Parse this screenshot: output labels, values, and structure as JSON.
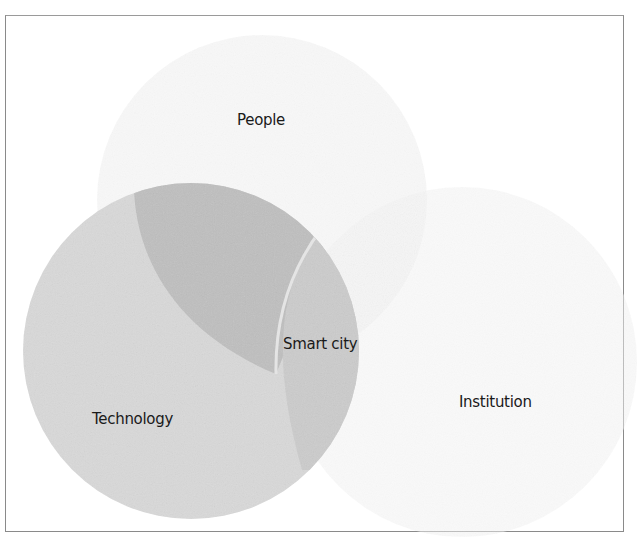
{
  "diagram": {
    "type": "venn",
    "sets": [
      {
        "id": "people",
        "label": "People",
        "color": "#f2f2f2"
      },
      {
        "id": "technology",
        "label": "Technology",
        "color": "#d6d6d6"
      },
      {
        "id": "institution",
        "label": "Institution",
        "color": "#f4f4f4"
      }
    ],
    "intersections": [
      {
        "sets": [
          "people",
          "technology"
        ],
        "color": "#bdbdbd"
      },
      {
        "sets": [
          "technology",
          "institution"
        ],
        "color": "#cacaca"
      },
      {
        "sets": [
          "people",
          "technology",
          "institution"
        ],
        "label": "Smart city",
        "color": "#c4c4c4"
      }
    ],
    "labels": {
      "people": "People",
      "technology": "Technology",
      "institution": "Institution",
      "center": "Smart city"
    },
    "colors": {
      "frame_border": "#8a8a8a",
      "background": "#ffffff",
      "text": "#1a1a1a"
    }
  }
}
